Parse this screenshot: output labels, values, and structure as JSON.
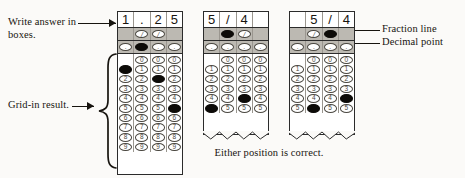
{
  "labels": {
    "write_answer": "Write answer in boxes.",
    "grid_in_result": "Grid-in result.",
    "fraction_line": "Fraction line",
    "decimal_point": "Decimal point",
    "caption": "Either position is correct."
  },
  "colors": {
    "ink": "#17140f",
    "paper": "#fbfaf8",
    "grid_band": "#bcb9b2",
    "bubble_fill": "#0d0b08",
    "bubble_outline": "#4a4740"
  },
  "bubble_symbols": {
    "fraction": "/",
    "decimal": ".",
    "digits": [
      "0",
      "1",
      "2",
      "3",
      "4",
      "5",
      "6",
      "7",
      "8",
      "9"
    ]
  },
  "grids": [
    {
      "id": "grid-1",
      "name": "decimal-answer-grid",
      "answer": "1.25",
      "truncated": false,
      "header": [
        "1",
        ".",
        "2",
        "5"
      ],
      "fraction_row": [
        {
          "present": false,
          "filled": false
        },
        {
          "present": true,
          "filled": false
        },
        {
          "present": true,
          "filled": false
        },
        {
          "present": false,
          "filled": false
        }
      ],
      "decimal_row": [
        {
          "present": true,
          "filled": false
        },
        {
          "present": true,
          "filled": true
        },
        {
          "present": true,
          "filled": false
        },
        {
          "present": true,
          "filled": false
        }
      ],
      "digit_rows": [
        "0",
        "1",
        "2",
        "3",
        "4",
        "5",
        "6",
        "7",
        "8",
        "9"
      ],
      "columns": [
        {
          "zero_present": false,
          "filled_digit": "1"
        },
        {
          "zero_present": true,
          "filled_digit": null
        },
        {
          "zero_present": true,
          "filled_digit": "2"
        },
        {
          "zero_present": true,
          "filled_digit": "5"
        }
      ]
    },
    {
      "id": "grid-2",
      "name": "fraction-answer-grid-left",
      "answer": "5/4",
      "truncated": true,
      "header": [
        "5",
        "/",
        "4",
        ""
      ],
      "fraction_row": [
        {
          "present": false,
          "filled": false
        },
        {
          "present": true,
          "filled": true
        },
        {
          "present": true,
          "filled": false
        },
        {
          "present": false,
          "filled": false
        }
      ],
      "decimal_row": [
        {
          "present": true,
          "filled": false
        },
        {
          "present": true,
          "filled": false
        },
        {
          "present": true,
          "filled": false
        },
        {
          "present": true,
          "filled": false
        }
      ],
      "digit_rows": [
        "0",
        "1",
        "2",
        "3",
        "4",
        "5"
      ],
      "columns": [
        {
          "zero_present": false,
          "filled_digit": "5"
        },
        {
          "zero_present": true,
          "filled_digit": null
        },
        {
          "zero_present": true,
          "filled_digit": "4"
        },
        {
          "zero_present": true,
          "filled_digit": null
        }
      ]
    },
    {
      "id": "grid-3",
      "name": "fraction-answer-grid-right",
      "answer": "5/4",
      "truncated": true,
      "header": [
        "",
        "5",
        "/",
        "4"
      ],
      "fraction_row": [
        {
          "present": false,
          "filled": false
        },
        {
          "present": true,
          "filled": false
        },
        {
          "present": true,
          "filled": true
        },
        {
          "present": false,
          "filled": false
        }
      ],
      "decimal_row": [
        {
          "present": true,
          "filled": false
        },
        {
          "present": true,
          "filled": false
        },
        {
          "present": true,
          "filled": false
        },
        {
          "present": true,
          "filled": false
        }
      ],
      "digit_rows": [
        "0",
        "1",
        "2",
        "3",
        "4",
        "5"
      ],
      "columns": [
        {
          "zero_present": false,
          "filled_digit": null
        },
        {
          "zero_present": true,
          "filled_digit": "5"
        },
        {
          "zero_present": true,
          "filled_digit": null
        },
        {
          "zero_present": true,
          "filled_digit": "4"
        }
      ]
    }
  ]
}
